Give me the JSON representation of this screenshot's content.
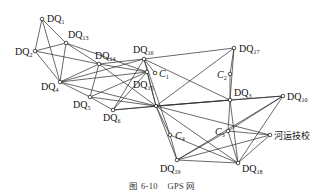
{
  "figure": {
    "caption_number": "图 6-10",
    "caption_title": "GPS 网"
  },
  "nodes": [
    {
      "id": "DQ1",
      "prefix": "DQ",
      "sub": "1",
      "x": 42,
      "y": 19,
      "lx": 47,
      "ly": 22
    },
    {
      "id": "DQ13",
      "prefix": "DQ",
      "sub": "13",
      "x": 66,
      "y": 43,
      "lx": 68,
      "ly": 38
    },
    {
      "id": "DQ2",
      "prefix": "DQ",
      "sub": "2",
      "x": 35,
      "y": 51,
      "lx": 15,
      "ly": 55
    },
    {
      "id": "DQ14",
      "prefix": "DQ",
      "sub": "14",
      "x": 99,
      "y": 64,
      "lx": 95,
      "ly": 59
    },
    {
      "id": "DQ16",
      "prefix": "DQ",
      "sub": "16",
      "x": 144,
      "y": 59,
      "lx": 133,
      "ly": 53
    },
    {
      "id": "C1",
      "prefix": "C",
      "sub": "1",
      "x": 155,
      "y": 73,
      "lx": 159,
      "ly": 77
    },
    {
      "id": "DQ15",
      "prefix": "DQ",
      "sub": "15",
      "x": 147,
      "y": 72,
      "lx": 133,
      "ly": 88
    },
    {
      "id": "DQ4",
      "prefix": "DQ",
      "sub": "4",
      "x": 60,
      "y": 82,
      "lx": 41,
      "ly": 90
    },
    {
      "id": "DQ5",
      "prefix": "DQ",
      "sub": "5",
      "x": 90,
      "y": 97,
      "lx": 73,
      "ly": 108
    },
    {
      "id": "DQ6",
      "prefix": "DQ",
      "sub": "6",
      "x": 113,
      "y": 110,
      "lx": 103,
      "ly": 121
    },
    {
      "id": "J1",
      "prefix": "",
      "sub": "",
      "x": 156,
      "y": 106,
      "lx": 0,
      "ly": 0
    },
    {
      "id": "C4",
      "prefix": "C",
      "sub": "4",
      "x": 170,
      "y": 135,
      "lx": 175,
      "ly": 139
    },
    {
      "id": "DQ17",
      "prefix": "DQ",
      "sub": "17",
      "x": 234,
      "y": 48,
      "lx": 239,
      "ly": 52
    },
    {
      "id": "C2",
      "prefix": "C",
      "sub": "2",
      "x": 230,
      "y": 74,
      "lx": 217,
      "ly": 78
    },
    {
      "id": "DQ3",
      "prefix": "DQ",
      "sub": "3",
      "x": 230,
      "y": 100,
      "lx": 234,
      "ly": 96
    },
    {
      "id": "DQ10",
      "prefix": "DQ",
      "sub": "10",
      "x": 283,
      "y": 96,
      "lx": 287,
      "ly": 100
    },
    {
      "id": "C3",
      "prefix": "C",
      "sub": "3",
      "x": 228,
      "y": 131,
      "lx": 215,
      "ly": 135
    },
    {
      "id": "HYJX",
      "prefix": "河运技校",
      "sub": "",
      "x": 270,
      "y": 135,
      "lx": 274,
      "ly": 139
    },
    {
      "id": "DQ19",
      "prefix": "DQ",
      "sub": "19",
      "x": 177,
      "y": 160,
      "lx": 160,
      "ly": 172
    },
    {
      "id": "DQ18",
      "prefix": "DQ",
      "sub": "18",
      "x": 238,
      "y": 163,
      "lx": 242,
      "ly": 172
    }
  ],
  "edges": [
    [
      "DQ1",
      "DQ2"
    ],
    [
      "DQ1",
      "DQ13"
    ],
    [
      "DQ1",
      "DQ4"
    ],
    [
      "DQ2",
      "DQ13"
    ],
    [
      "DQ2",
      "DQ4"
    ],
    [
      "DQ2",
      "DQ14"
    ],
    [
      "DQ13",
      "DQ4"
    ],
    [
      "DQ13",
      "DQ14"
    ],
    [
      "DQ13",
      "DQ15"
    ],
    [
      "DQ14",
      "DQ4"
    ],
    [
      "DQ14",
      "DQ16"
    ],
    [
      "DQ14",
      "DQ15"
    ],
    [
      "DQ14",
      "J1"
    ],
    [
      "DQ14",
      "DQ5"
    ],
    [
      "DQ16",
      "DQ17"
    ],
    [
      "DQ16",
      "DQ3"
    ],
    [
      "DQ16",
      "C1"
    ],
    [
      "DQ16",
      "J1"
    ],
    [
      "DQ16",
      "C4"
    ],
    [
      "DQ16",
      "DQ6"
    ],
    [
      "DQ15",
      "DQ4"
    ],
    [
      "DQ15",
      "DQ5"
    ],
    [
      "DQ15",
      "DQ6"
    ],
    [
      "DQ15",
      "J1"
    ],
    [
      "DQ4",
      "DQ5"
    ],
    [
      "DQ4",
      "J1"
    ],
    [
      "DQ4",
      "DQ16"
    ],
    [
      "DQ5",
      "DQ6"
    ],
    [
      "DQ5",
      "J1"
    ],
    [
      "DQ6",
      "J1"
    ],
    [
      "DQ6",
      "DQ3"
    ],
    [
      "J1",
      "DQ17"
    ],
    [
      "J1",
      "DQ3"
    ],
    [
      "J1",
      "DQ10"
    ],
    [
      "J1",
      "C4"
    ],
    [
      "J1",
      "DQ19"
    ],
    [
      "J1",
      "DQ18"
    ],
    [
      "J1",
      "HYJX"
    ],
    [
      "DQ17",
      "C2"
    ],
    [
      "DQ17",
      "DQ3"
    ],
    [
      "C2",
      "DQ3"
    ],
    [
      "DQ3",
      "DQ10"
    ],
    [
      "DQ3",
      "C3"
    ],
    [
      "DQ3",
      "DQ18"
    ],
    [
      "DQ10",
      "C3"
    ],
    [
      "DQ10",
      "DQ18"
    ],
    [
      "DQ10",
      "DQ19"
    ],
    [
      "C3",
      "DQ19"
    ],
    [
      "C3",
      "DQ18"
    ],
    [
      "HYJX",
      "DQ18"
    ],
    [
      "HYJX",
      "DQ19"
    ],
    [
      "HYJX",
      "C3"
    ],
    [
      "DQ19",
      "DQ18"
    ],
    [
      "C4",
      "DQ19"
    ],
    [
      "C4",
      "DQ18"
    ]
  ]
}
